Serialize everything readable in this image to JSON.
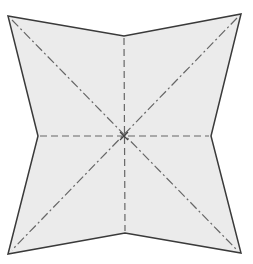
{
  "diagram": {
    "colors": {
      "fill": "#ebebeb",
      "outline": "#3a3a3a",
      "fold": "#666666"
    },
    "outline_points": "8,16 124,36 241,14 211,136 241,253 125,233 8,254 38,136",
    "center": {
      "x": 124,
      "y": 136
    },
    "mountain_folds": [
      {
        "x1": 12,
        "y1": 20,
        "x2": 237,
        "y2": 250
      },
      {
        "x1": 237,
        "y1": 18,
        "x2": 12,
        "y2": 250
      }
    ],
    "valley_folds": [
      {
        "x1": 124,
        "y1": 38,
        "x2": 125,
        "y2": 231
      },
      {
        "x1": 40,
        "y1": 136,
        "x2": 209,
        "y2": 136
      }
    ]
  }
}
